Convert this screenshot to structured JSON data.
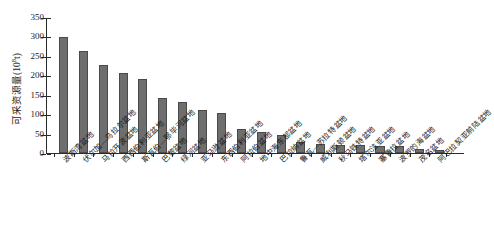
{
  "chart_data": {
    "type": "bar",
    "title": "",
    "xlabel": "",
    "ylabel": "可采资源量(10⁸t)",
    "ylabel_main": "可采资源量(10",
    "ylabel_sup": "8",
    "ylabel_tail": "t)",
    "ylim": [
      0,
      350
    ],
    "ytick_values": [
      0,
      50,
      100,
      150,
      200,
      250,
      300,
      350
    ],
    "ytick_labels": [
      "0",
      "50",
      "100",
      "150",
      "200",
      "250",
      "300",
      "350"
    ],
    "grid": false,
    "legend": false,
    "bar_color": "#6e6e6e",
    "bar_edge_color": "#4a4a4a",
    "axis_color": "#2b2b2b",
    "categories": [
      "波斯湾盆地",
      "伏尔加—乌拉尔盆地",
      "马拉开波盆地",
      "西西伯利亚盆地",
      "斯瓦伯—鄂毕河盆地",
      "巴黎盆地",
      "绿河盆地",
      "亚马逊盆地",
      "东西伯利亚盆地",
      "阿拉伯盆地",
      "地中海东部盆地",
      "巴拉纳盆地",
      "鲁瓦—苏拉特盆地",
      "威利斯顿盆地",
      "秋马铁特盆地",
      "塔尔法亚盆地",
      "塞鲁拉盆地",
      "波罗的海盆地",
      "茂名盆地",
      "阿巴拉契亚前陆盆地"
    ],
    "values": [
      300,
      265,
      227,
      206,
      191,
      142,
      131,
      110,
      102,
      62,
      54,
      47,
      28,
      22,
      21,
      19,
      18,
      17,
      10,
      8
    ]
  }
}
